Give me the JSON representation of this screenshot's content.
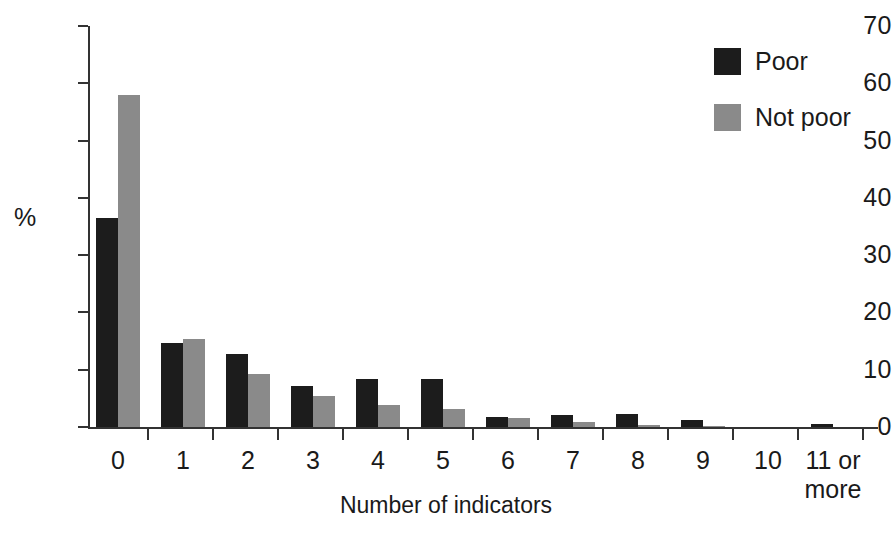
{
  "chart_data": {
    "type": "bar",
    "title": "",
    "subtitle": "",
    "xlabel": "Number of indicators",
    "ylabel": "%",
    "categories": [
      "0",
      "1",
      "2",
      "3",
      "4",
      "5",
      "6",
      "7",
      "8",
      "9",
      "10",
      "11 or\nmore"
    ],
    "ytick_labels": [
      "70",
      "60",
      "50",
      "40",
      "30",
      "20",
      "10",
      "0"
    ],
    "ytick_values": [
      70,
      60,
      50,
      40,
      30,
      20,
      10,
      0
    ],
    "ylim": [
      0,
      70
    ],
    "grid": false,
    "legend_position": "top-right",
    "series": [
      {
        "name": "Poor",
        "color": "#1c1c1c",
        "values": [
          36.5,
          14.6,
          12.8,
          7.2,
          8.3,
          8.3,
          1.8,
          2.1,
          2.3,
          1.3,
          0.0,
          0.5
        ]
      },
      {
        "name": "Not poor",
        "color": "#8a8a8a",
        "values": [
          58.0,
          15.3,
          9.2,
          5.4,
          3.8,
          3.2,
          1.6,
          0.9,
          0.3,
          0.2,
          0.0,
          0.0
        ]
      }
    ]
  },
  "legend": {
    "items": [
      {
        "label": "Poor",
        "color": "#1c1c1c",
        "swatch_name": "legend-swatch-poor"
      },
      {
        "label": "Not poor",
        "color": "#8a8a8a",
        "swatch_name": "legend-swatch-not-poor"
      }
    ]
  },
  "axes": {
    "y_title": "%",
    "x_title": "Number of indicators"
  }
}
